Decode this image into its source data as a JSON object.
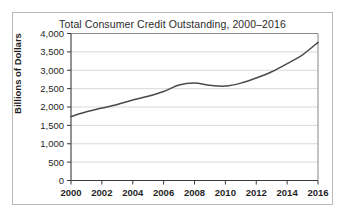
{
  "chart_data": {
    "type": "line",
    "title": "Total Consumer Credit Outstanding, 2000–2016",
    "xlabel": "",
    "ylabel": "Billions of Dollars",
    "xlim": [
      2000,
      2016
    ],
    "ylim": [
      0,
      4000
    ],
    "grid": "horizontal",
    "legend": "none",
    "x_tick_labels": [
      "2000",
      "2002",
      "2004",
      "2006",
      "2008",
      "2010",
      "2012",
      "2014",
      "2016"
    ],
    "x_ticks": [
      2000,
      2002,
      2004,
      2006,
      2008,
      2010,
      2012,
      2014,
      2016
    ],
    "y_tick_labels": [
      "0",
      "500",
      "1,000",
      "1,500",
      "2,000",
      "2,500",
      "3,000",
      "3,500",
      "4,000"
    ],
    "y_ticks": [
      0,
      500,
      1000,
      1500,
      2000,
      2500,
      3000,
      3500,
      4000
    ],
    "series": [
      {
        "name": "Total Consumer Credit Outstanding",
        "color": "#4a4a4a",
        "x": [
          2000,
          2001,
          2002,
          2003,
          2004,
          2005,
          2006,
          2007,
          2008,
          2009,
          2010,
          2011,
          2012,
          2013,
          2014,
          2015,
          2016
        ],
        "values": [
          1740,
          1870,
          1970,
          2070,
          2190,
          2290,
          2420,
          2600,
          2650,
          2590,
          2570,
          2650,
          2790,
          2960,
          3180,
          3420,
          3760
        ]
      }
    ]
  },
  "axes": {
    "y_axis_title": "Billions of Dollars"
  }
}
